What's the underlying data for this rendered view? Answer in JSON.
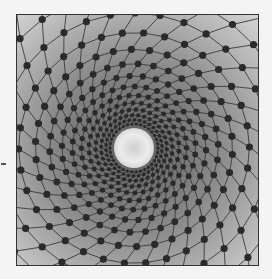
{
  "image": {
    "description": "Grayscale photograph of a spiral lattice of dark dots connected by curved lines, converging toward a bright central disc",
    "background": "#f4f4f4",
    "frame_color": "#333333",
    "center": {
      "x": 117,
      "y": 133,
      "radius": 20,
      "color": "#e6e6e6"
    },
    "lattice": {
      "rings": 16,
      "spokes": 34,
      "inner_radius": 24,
      "growth": 1.17,
      "twist_per_ring": 0.11,
      "dot_color": "#2a2a2a",
      "line_color": "#3a3a3a"
    },
    "gradient": {
      "dark": "#5a5a5a",
      "mid": "#8a8a8a",
      "light": "#dcdcdc"
    }
  }
}
